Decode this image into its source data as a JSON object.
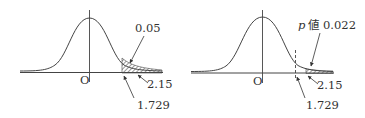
{
  "figures": [
    {
      "id": "left",
      "origin_label": "O",
      "critical_value_label": "1.729",
      "test_statistic_label": "2.15",
      "area_label": "0.05",
      "shaded_region": "rejection region right of 1.729"
    },
    {
      "id": "right",
      "origin_label": "O",
      "critical_value_label": "1.729",
      "test_statistic_label": "2.15",
      "area_label_prefix": "p",
      "area_label_text": "値 0.022",
      "shaded_region": "tail right of 2.15"
    }
  ],
  "colors": {
    "line": "#444444",
    "text": "#333333",
    "background": "#ffffff"
  }
}
